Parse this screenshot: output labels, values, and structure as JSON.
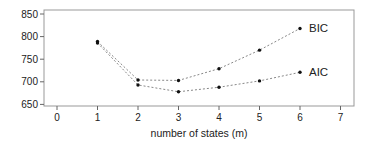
{
  "chart_data": {
    "type": "line",
    "title": "",
    "xlabel": "number of states (m)",
    "ylabel": "",
    "xlim": [
      -0.3,
      7.3
    ],
    "ylim": [
      645,
      858
    ],
    "x_ticks": [
      0,
      1,
      2,
      3,
      4,
      5,
      6,
      7
    ],
    "y_ticks": [
      650,
      700,
      750,
      800,
      850
    ],
    "grid": false,
    "legend_position": "inline labels at line ends",
    "x": [
      1,
      2,
      3,
      4,
      5,
      6
    ],
    "series": [
      {
        "name": "BIC",
        "values": [
          789,
          704,
          703,
          729,
          770,
          818
        ]
      },
      {
        "name": "AIC",
        "values": [
          786,
          693,
          678,
          688,
          702,
          721
        ]
      }
    ],
    "line_style": "dotted",
    "colors": {
      "line": "#888888",
      "point": "#111111",
      "axis": "#444444",
      "text": "#222222"
    }
  }
}
